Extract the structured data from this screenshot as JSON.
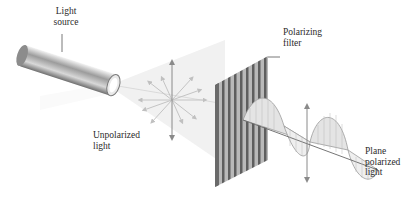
{
  "figure": {
    "labels": {
      "light_source": "Light\nsource",
      "polarizing_filter": "Polarizing\nfilter",
      "unpolarized_light": "Unpolarized\nlight",
      "plane_polarized_light": "Plane\npolarized\nlight"
    },
    "components": [
      {
        "name": "light-source",
        "shape": "cylinder"
      },
      {
        "name": "unpolarized-light",
        "shape": "radial arrows (multiple orientations)"
      },
      {
        "name": "polarizing-filter",
        "shape": "striped vertical grating"
      },
      {
        "name": "plane-polarized-light",
        "shape": "sine wave with vertical arrow"
      }
    ],
    "colors": {
      "background": "#ffffff",
      "beam": "#eeeeee",
      "arrow": "#8a8a8a",
      "filter_dark": "#5a5a5a",
      "filter_light": "#b5b5b5",
      "wave_fill": "#e6e6e6",
      "text": "#2b2b2b"
    }
  }
}
